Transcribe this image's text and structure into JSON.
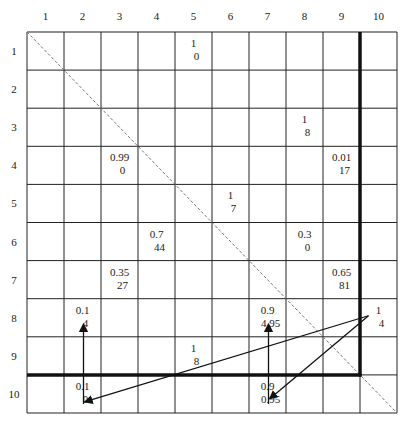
{
  "grid": {
    "rows": 10,
    "cols": 10,
    "col_labels": [
      "1",
      "2",
      "3",
      "4",
      "5",
      "6",
      "7",
      "8",
      "9",
      "10"
    ],
    "row_labels": [
      "1",
      "2",
      "3",
      "4",
      "5",
      "6",
      "7",
      "8",
      "9",
      "10"
    ],
    "colors": {
      "line": "#222222",
      "thick": "#111111",
      "diagonal": "#777777",
      "text": "#1a1a1a"
    }
  },
  "cells": [
    {
      "row": 1,
      "col": 5,
      "top": "1",
      "bottom": "0"
    },
    {
      "row": 3,
      "col": 8,
      "top": "1",
      "bottom": "8"
    },
    {
      "row": 4,
      "col": 3,
      "top": "0.99",
      "bottom": "0"
    },
    {
      "row": 4,
      "col": 9,
      "top": "0.01",
      "bottom": "17"
    },
    {
      "row": 5,
      "col": 6,
      "top": "1",
      "bottom": "7"
    },
    {
      "row": 6,
      "col": 4,
      "top": "0.7",
      "bottom": "44"
    },
    {
      "row": 6,
      "col": 8,
      "top": "0.3",
      "bottom": "0"
    },
    {
      "row": 7,
      "col": 3,
      "top": "0.35",
      "bottom": "27"
    },
    {
      "row": 7,
      "col": 9,
      "top": "0.65",
      "bottom": "81"
    },
    {
      "row": 8,
      "col": 2,
      "top": "0.1",
      "bottom": "4"
    },
    {
      "row": 8,
      "col": 7,
      "top": "0.9",
      "bottom": "4.95"
    },
    {
      "row": 8,
      "col": 10,
      "top": "1",
      "bottom": "4"
    },
    {
      "row": 9,
      "col": 5,
      "top": "1",
      "bottom": "8"
    },
    {
      "row": 10,
      "col": 2,
      "top": "0.1",
      "bottom": "0"
    },
    {
      "row": 10,
      "col": 7,
      "top": "0.9",
      "bottom": "0.95"
    }
  ],
  "boundary": {
    "vertical_after_col": 9,
    "vertical_to_row": 9,
    "horizontal_after_row": 9,
    "horizontal_to_col": 9
  },
  "arrows": [
    {
      "from": {
        "row": 10,
        "col": 2
      },
      "to": {
        "row": 8,
        "col": 2
      },
      "label": "up-arrow-col2"
    },
    {
      "from": {
        "row": 10,
        "col": 7
      },
      "to": {
        "row": 8,
        "col": 7
      },
      "label": "up-arrow-col7"
    },
    {
      "from": {
        "row": 8,
        "col": 10
      },
      "to": {
        "row": 10,
        "col": 2
      },
      "label": "arrow-to-r10c2"
    },
    {
      "from": {
        "row": 8,
        "col": 10
      },
      "to": {
        "row": 10,
        "col": 7
      },
      "label": "arrow-to-r10c7"
    }
  ]
}
